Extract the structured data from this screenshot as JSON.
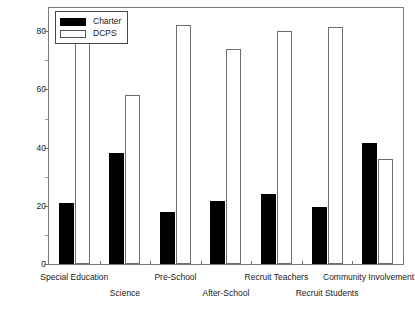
{
  "chart_data": {
    "type": "bar",
    "title": "",
    "xlabel": "",
    "ylabel": "Percent of Principals",
    "ylim": [
      0,
      88
    ],
    "yticks": [
      0,
      20,
      40,
      60,
      80
    ],
    "ytick_labels": [
      "0",
      "20",
      "40",
      "60",
      "80"
    ],
    "grid": false,
    "legend_position": "top-left",
    "categories": [
      "Special Education",
      "Science",
      "Pre-School",
      "After-School",
      "Recruit Teachers",
      "Recruit Students",
      "Community Involvement"
    ],
    "series": [
      {
        "name": "Charter",
        "color": "#000000",
        "values": [
          21,
          38,
          18,
          21.5,
          24,
          19.5,
          41.5
        ]
      },
      {
        "name": "DCPS",
        "color": "#ffffff",
        "values": [
          81,
          58,
          82,
          74,
          80,
          81.5,
          36
        ]
      }
    ]
  },
  "legend": {
    "items": [
      {
        "label": "Charter",
        "style": "filled-black"
      },
      {
        "label": "DCPS",
        "style": "outlined-white"
      }
    ]
  },
  "axes": {
    "y_title": "Percent of Principals",
    "y_tick_labels": [
      "80",
      "60",
      "40",
      "20",
      "0"
    ]
  },
  "x_axis_labels": [
    {
      "text": "Special Education",
      "row": 0
    },
    {
      "text": "Science",
      "row": 1
    },
    {
      "text": "Pre-School",
      "row": 0
    },
    {
      "text": "After-School",
      "row": 1
    },
    {
      "text": "Recruit Teachers",
      "row": 0
    },
    {
      "text": "Recruit Students",
      "row": 1
    },
    {
      "text": "Community Involvement",
      "row": 0
    }
  ]
}
